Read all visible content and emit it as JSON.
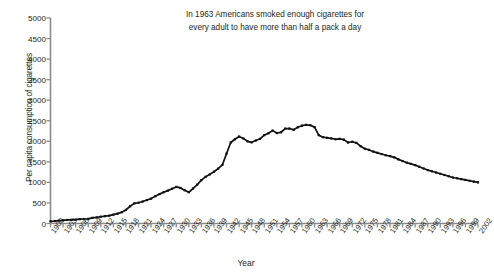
{
  "chart_data": {
    "type": "line",
    "title": "In 1963 Americans smoked enough cigarettes for every adult to have more than half a pack a day",
    "title_line1": "In 1963 Americans smoked enough cigarettes for",
    "title_line2": "every adult to have more than half a pack a day",
    "xlabel": "Year",
    "ylabel": "Per capita consumption of cigarettes",
    "xlim": [
      1900,
      2002
    ],
    "ylim": [
      0,
      5000
    ],
    "ytick_labels": [
      "0",
      "500",
      "1000",
      "1500",
      "2000",
      "2500",
      "3000",
      "3500",
      "4000",
      "4500",
      "5000"
    ],
    "ytick_values": [
      0,
      500,
      1000,
      1500,
      2000,
      2500,
      3000,
      3500,
      4000,
      4500,
      5000
    ],
    "ytick_step": 500,
    "xtick_labels": [
      "1900",
      "1903",
      "1906",
      "1909",
      "1912",
      "1915",
      "1918",
      "1921",
      "1924",
      "1927",
      "1930",
      "1933",
      "1936",
      "1939",
      "1942",
      "1945",
      "1948",
      "1951",
      "1954",
      "1957",
      "1960",
      "1963",
      "1966",
      "1969",
      "1972",
      "1975",
      "1978",
      "1981",
      "1984",
      "1987",
      "1990",
      "1993",
      "1996",
      "1999",
      "2002"
    ],
    "xtick_step": 3,
    "grid": false,
    "legend": null,
    "marker": "square",
    "line_color": "#000000",
    "axis_color": "#808080",
    "x": [
      1900,
      1901,
      1902,
      1903,
      1904,
      1905,
      1906,
      1907,
      1908,
      1909,
      1910,
      1911,
      1912,
      1913,
      1914,
      1915,
      1916,
      1917,
      1918,
      1919,
      1920,
      1921,
      1922,
      1923,
      1924,
      1925,
      1926,
      1927,
      1928,
      1929,
      1930,
      1931,
      1932,
      1933,
      1934,
      1935,
      1936,
      1937,
      1938,
      1939,
      1940,
      1941,
      1942,
      1943,
      1944,
      1945,
      1946,
      1947,
      1948,
      1949,
      1950,
      1951,
      1952,
      1953,
      1954,
      1955,
      1956,
      1957,
      1958,
      1959,
      1960,
      1961,
      1962,
      1963,
      1964,
      1965,
      1966,
      1967,
      1968,
      1969,
      1970,
      1971,
      1972,
      1973,
      1974,
      1975,
      1976,
      1977,
      1978,
      1979,
      1980,
      1981,
      1982,
      1983,
      1984,
      1985,
      1986,
      1987,
      1988,
      1989,
      1990,
      1991,
      1992,
      1993,
      1994,
      1995,
      1996,
      1997,
      1998,
      1999,
      2000,
      2001,
      2002
    ],
    "y": [
      54,
      60,
      70,
      78,
      86,
      90,
      96,
      105,
      109,
      113,
      138,
      148,
      165,
      178,
      190,
      215,
      240,
      275,
      330,
      420,
      490,
      505,
      535,
      570,
      605,
      665,
      715,
      760,
      800,
      845,
      890,
      865,
      810,
      760,
      850,
      945,
      1055,
      1135,
      1195,
      1260,
      1335,
      1425,
      1700,
      1970,
      2050,
      2115,
      2070,
      2000,
      1975,
      2020,
      2060,
      2150,
      2195,
      2260,
      2200,
      2220,
      2310,
      2310,
      2280,
      2340,
      2380,
      2400,
      2390,
      2345,
      2150,
      2100,
      2085,
      2070,
      2050,
      2060,
      2040,
      1970,
      1990,
      1960,
      1880,
      1820,
      1790,
      1750,
      1720,
      1690,
      1660,
      1640,
      1610,
      1560,
      1520,
      1480,
      1450,
      1420,
      1380,
      1340,
      1300,
      1270,
      1240,
      1210,
      1180,
      1150,
      1120,
      1100,
      1080,
      1060,
      1040,
      1020,
      1000
    ]
  },
  "chart_data_scaled_note": "values_plotted"
}
